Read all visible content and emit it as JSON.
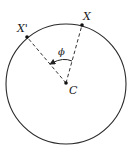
{
  "diagram": {
    "type": "geometry",
    "circle": {
      "cx": 66,
      "cy": 84,
      "r": 60
    },
    "center": {
      "label": "C",
      "x": 66,
      "y": 83
    },
    "points": [
      {
        "id": "X",
        "label": "X",
        "x": 82,
        "y": 25
      },
      {
        "id": "Xprime",
        "label": "X'",
        "x": 27,
        "y": 37
      }
    ],
    "angle": {
      "label": "ϕ",
      "from": "X",
      "to": "X'",
      "vertex": "C"
    },
    "colors": {
      "stroke": "#222222",
      "point": "#111111",
      "background": "#ffffff"
    }
  }
}
